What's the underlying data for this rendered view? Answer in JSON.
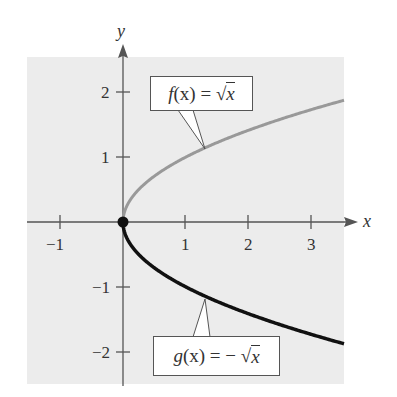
{
  "chart_data": {
    "type": "line",
    "title": "",
    "xlabel": "x",
    "ylabel": "y",
    "xlim": [
      -1.5,
      3.6
    ],
    "ylim": [
      -2.5,
      2.5
    ],
    "grid": false,
    "x_ticks": [
      -1,
      1,
      2,
      3
    ],
    "y_ticks": [
      -2,
      -1,
      1,
      2
    ],
    "x_tick_labels": [
      "−1",
      "1",
      "2",
      "3"
    ],
    "y_tick_labels": [
      "−2",
      "−1",
      "1",
      "2"
    ],
    "series": [
      {
        "name": "f(x) = √x",
        "color": "#999999",
        "x": [
          0,
          0.25,
          0.5,
          1,
          1.5,
          2,
          2.5,
          3,
          3.5
        ],
        "values": [
          0,
          0.5,
          0.71,
          1,
          1.22,
          1.41,
          1.58,
          1.73,
          1.87
        ]
      },
      {
        "name": "g(x) = −√x",
        "color": "#111111",
        "x": [
          0,
          0.25,
          0.5,
          1,
          1.5,
          2,
          2.5,
          3,
          3.5
        ],
        "values": [
          0,
          -0.5,
          -0.71,
          -1,
          -1.22,
          -1.41,
          -1.58,
          -1.73,
          -1.87
        ]
      }
    ],
    "annotations": [
      {
        "text": "f(x) = √x",
        "points_to": [
          1.3,
          1.14
        ]
      },
      {
        "text": "g(x) = −√x",
        "points_to": [
          1.3,
          -1.14
        ]
      }
    ],
    "points": [
      {
        "x": 0,
        "y": 0,
        "style": "filled-circle"
      }
    ]
  },
  "labels": {
    "x_axis": "x",
    "y_axis": "y",
    "f_label": {
      "f": "f",
      "rest": "(x) = ",
      "rad": "x"
    },
    "g_label": {
      "g": "g",
      "rest": "(x) = − ",
      "rad": "x"
    },
    "x_ticks": [
      "−1",
      "1",
      "2",
      "3"
    ],
    "y_ticks": [
      "2",
      "1",
      "−1",
      "−2"
    ]
  },
  "colors": {
    "panel": "#ececec",
    "axis": "#555555",
    "f_curve": "#999999",
    "g_curve": "#111111"
  }
}
